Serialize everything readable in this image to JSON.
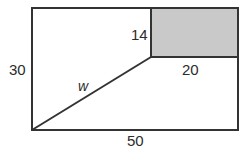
{
  "figure": {
    "type": "geometry-diagram",
    "colors": {
      "background": "#ffffff",
      "stroke": "#333333",
      "shaded_fill": "#c9c9c9",
      "text": "#2b2b2b"
    },
    "outer_rectangle": {
      "name": "outer-rectangle",
      "x": 32,
      "y": 8,
      "width": 206,
      "height": 122,
      "fill": "none",
      "stroke_width": 2
    },
    "shaded_rectangle": {
      "name": "shaded-rectangle",
      "x": 151,
      "y": 8,
      "width": 87,
      "height": 49,
      "fill": "#c9c9c9",
      "stroke_width": 2
    },
    "diagonal_segment": {
      "name": "diagonal-segment-w",
      "x1": 32,
      "y1": 130,
      "x2": 151,
      "y2": 57,
      "stroke_width": 2
    },
    "labels": [
      {
        "id": "label-height-left",
        "name": "dimension-label-left-height",
        "text": "30",
        "style": "plain"
      },
      {
        "id": "label-base-bottom",
        "name": "dimension-label-bottom-base",
        "text": "50",
        "style": "plain"
      },
      {
        "id": "label-inner-height",
        "name": "dimension-label-inner-height",
        "text": "14",
        "style": "plain"
      },
      {
        "id": "label-inner-base",
        "name": "dimension-label-inner-base",
        "text": "20",
        "style": "plain"
      },
      {
        "id": "label-diagonal",
        "name": "dimension-label-diagonal",
        "text": "w",
        "style": "italic"
      }
    ]
  }
}
